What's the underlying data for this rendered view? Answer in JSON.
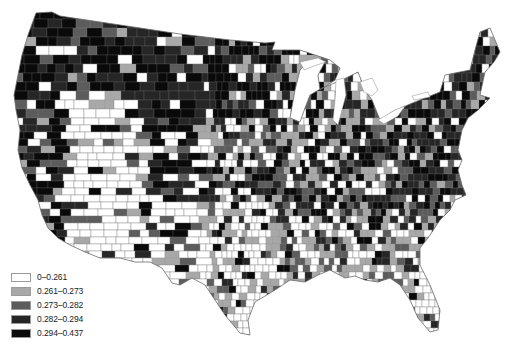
{
  "map": {
    "type": "choropleth",
    "region": "Contiguous United States (counties)",
    "background": "#ffffff",
    "border_color": "#8a8a8a"
  },
  "legend": {
    "items": [
      {
        "label": "0–0.261",
        "color": "#ffffff"
      },
      {
        "label": "0.261–0.273",
        "color": "#a8a8a8"
      },
      {
        "label": "0.273–0.282",
        "color": "#5c5c5c"
      },
      {
        "label": "0.282–0.294",
        "color": "#262626"
      },
      {
        "label": "0.294–0.437",
        "color": "#0a0a0a"
      }
    ]
  }
}
